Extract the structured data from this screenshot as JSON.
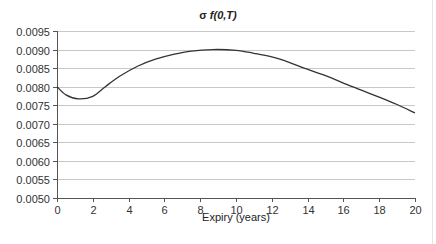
{
  "chart_data": {
    "type": "line",
    "title": "σ f(0,T)",
    "title_parts": {
      "symbol": "σ ",
      "function": "f(0,T)"
    },
    "xlabel": "Expiry (years)",
    "ylabel": "",
    "xlim": [
      0,
      20
    ],
    "ylim": [
      0.005,
      0.0095
    ],
    "x_ticks": [
      "0",
      "2",
      "4",
      "6",
      "8",
      "10",
      "12",
      "14",
      "16",
      "18",
      "20"
    ],
    "y_ticks": [
      "0.0095",
      "0.0090",
      "0.0085",
      "0.0080",
      "0.0075",
      "0.0070",
      "0.0065",
      "0.0060",
      "0.0055",
      "0.0050"
    ],
    "grid": {
      "horizontal": true,
      "vertical": false
    },
    "legend": null,
    "series": [
      {
        "name": "σ f(0,T)",
        "color": "#333333",
        "x": [
          0,
          0.5,
          1.2,
          2,
          2.7,
          3.5,
          4.5,
          5.5,
          6.5,
          7.5,
          8.7,
          10,
          11,
          12,
          13,
          13.8,
          15,
          16.5,
          18,
          19,
          20
        ],
        "values": [
          0.008,
          0.00778,
          0.00767,
          0.00774,
          0.008,
          0.00828,
          0.00855,
          0.00874,
          0.00887,
          0.00896,
          0.009,
          0.00898,
          0.0089,
          0.0088,
          0.00865,
          0.0085,
          0.0083,
          0.008,
          0.00772,
          0.00752,
          0.00729
        ]
      }
    ]
  }
}
